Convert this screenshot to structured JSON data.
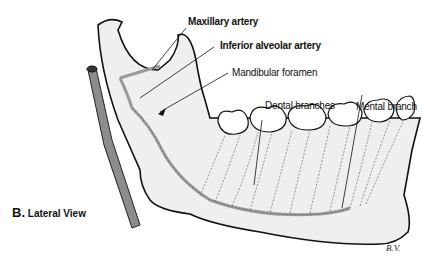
{
  "figure": {
    "panel_letter": "B.",
    "panel_title": "Lateral View",
    "signature": "B.V."
  },
  "labels": [
    {
      "id": "maxillary-artery",
      "text": "Maxillary artery",
      "bold": true
    },
    {
      "id": "inferior-alveolar-artery",
      "text": "Inferior alveolar artery",
      "bold": true
    },
    {
      "id": "mandibular-foramen",
      "text": "Mandibular foramen",
      "bold": false
    },
    {
      "id": "dental-branches",
      "text": "Dental branches",
      "bold": false
    },
    {
      "id": "mental-branch",
      "text": "Mental branch",
      "bold": false
    }
  ],
  "colors": {
    "bone_fill": "#eeeeee",
    "outline": "#111111",
    "vessel": "#9a9a9a",
    "carotid": "#8a8a8a"
  }
}
